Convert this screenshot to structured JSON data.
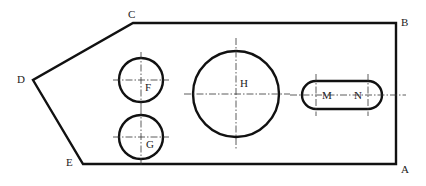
{
  "diagram": {
    "type": "technical-drawing",
    "vertices": [
      {
        "label": "A",
        "x": 396,
        "y": 164,
        "label_x": 401,
        "label_y": 173
      },
      {
        "label": "B",
        "x": 396,
        "y": 23,
        "label_x": 401,
        "label_y": 26
      },
      {
        "label": "C",
        "x": 133,
        "y": 23,
        "label_x": 128,
        "label_y": 18
      },
      {
        "label": "D",
        "x": 33,
        "y": 80,
        "label_x": 17,
        "label_y": 83
      },
      {
        "label": "E",
        "x": 83,
        "y": 164,
        "label_x": 66,
        "label_y": 166
      }
    ],
    "circles": [
      {
        "label": "F",
        "cx": 141,
        "cy": 80,
        "r": 22,
        "label_x": 145,
        "label_y": 91
      },
      {
        "label": "G",
        "cx": 141,
        "cy": 137,
        "r": 22,
        "label_x": 146,
        "label_y": 148
      },
      {
        "label": "H",
        "cx": 236,
        "cy": 94,
        "r": 43,
        "label_x": 240,
        "label_y": 87
      }
    ],
    "slot": {
      "label_left": "M",
      "label_right": "N",
      "cx1": 316,
      "cx2": 368,
      "cy": 95,
      "r": 14,
      "label_left_x": 322,
      "label_right_x": 354,
      "label_y": 99
    },
    "colors": {
      "line": "#111111",
      "centerline": "#333333",
      "background": "#ffffff"
    }
  }
}
